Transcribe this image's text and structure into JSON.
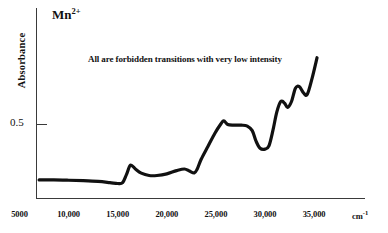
{
  "chart_data": {
    "type": "line",
    "title": "",
    "species_label": "Mn",
    "species_charge": "2+",
    "annotation": "All are forbidden transitions with very low intensity",
    "xlabel": "",
    "ylabel": "Absorbance",
    "xunit": "cm",
    "xunit_exponent": "-1",
    "xlim": [
      5000,
      36000
    ],
    "ylim": [
      0,
      1.05
    ],
    "grid": false,
    "legend": null,
    "xticks": [
      5000,
      10000,
      15000,
      20000,
      25000,
      30000,
      35000
    ],
    "xtick_labels": [
      "5000",
      "10,000",
      "15,000",
      "20,000",
      "25,000",
      "30,000",
      "35,000"
    ],
    "yticks": [
      0.5
    ],
    "ytick_labels": [
      "0.5"
    ],
    "line_color": "#111111",
    "line_width": 3.2,
    "series": [
      {
        "name": "Mn2+ absorbance spectrum",
        "x": [
          7000,
          8500,
          10000,
          11500,
          13000,
          14200,
          15000,
          15500,
          15900,
          16300,
          16800,
          17400,
          18200,
          19000,
          20000,
          21000,
          21800,
          22300,
          22800,
          23100,
          23500,
          24200,
          24900,
          25500,
          25800,
          26200,
          26800,
          27600,
          28200,
          28700,
          29100,
          29500,
          30000,
          30400,
          30800,
          31200,
          31600,
          32000,
          32300,
          32700,
          33100,
          33500,
          33900,
          34300,
          34800,
          35300
        ],
        "y": [
          0.122,
          0.122,
          0.12,
          0.117,
          0.112,
          0.104,
          0.098,
          0.104,
          0.16,
          0.222,
          0.196,
          0.168,
          0.152,
          0.152,
          0.163,
          0.185,
          0.196,
          0.182,
          0.17,
          0.196,
          0.262,
          0.35,
          0.438,
          0.5,
          0.522,
          0.497,
          0.492,
          0.492,
          0.486,
          0.455,
          0.382,
          0.336,
          0.33,
          0.352,
          0.455,
          0.58,
          0.652,
          0.64,
          0.612,
          0.652,
          0.742,
          0.752,
          0.712,
          0.7,
          0.81,
          0.948
        ]
      }
    ]
  },
  "axes": {
    "y_axis_name": "absorbance-axis",
    "x_axis_name": "wavenumber-axis"
  }
}
